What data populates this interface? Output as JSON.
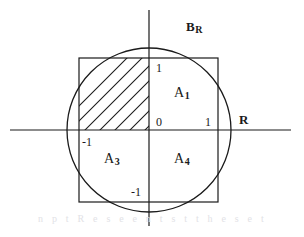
{
  "figure": {
    "background_color": "#ffffff",
    "stroke_color": "#1a1a1a",
    "text_color": "#1a1a1a"
  },
  "geometry": {
    "origin": {
      "x": 149,
      "y": 130
    },
    "circle": {
      "cx": 149,
      "cy": 130,
      "r": 82
    },
    "square": {
      "x": 79,
      "y": 58,
      "width": 139,
      "height": 144
    },
    "x_axis": {
      "x1": 10,
      "y1": 130,
      "x2": 291,
      "y2": 130
    },
    "y_axis": {
      "x1": 149,
      "y1": 10,
      "x2": 149,
      "y2": 226
    },
    "hatching": {
      "angle_degrees": 45,
      "direction": "lower-left to upper-right",
      "spacing": 15,
      "count": 7,
      "region": "upper-left quadrant bounded by square and circle"
    }
  },
  "labels": {
    "set_label": {
      "base": "B",
      "sub": "R",
      "x": 186,
      "y": 26
    },
    "axis_label_r": {
      "text": "R",
      "x": 239,
      "y": 113
    },
    "tick_y_positive": {
      "text": "1",
      "x": 156,
      "y": 62
    },
    "tick_origin": {
      "text": "0",
      "x": 156,
      "y": 116
    },
    "tick_x_positive": {
      "text": "1",
      "x": 205,
      "y": 116
    },
    "tick_x_negative": {
      "text": "-1",
      "x": 82,
      "y": 136
    },
    "tick_y_negative": {
      "text": "-1",
      "x": 131,
      "y": 186
    },
    "region_a1": {
      "base": "A",
      "sub": "1",
      "x": 174,
      "y": 88
    },
    "region_a3": {
      "base": "A",
      "sub": "3",
      "x": 104,
      "y": 154
    },
    "region_a4": {
      "base": "A",
      "sub": "4",
      "x": 174,
      "y": 154
    }
  },
  "scan_artifact": {
    "text": "n p t R e s e e n t s t t h e s e t s"
  }
}
